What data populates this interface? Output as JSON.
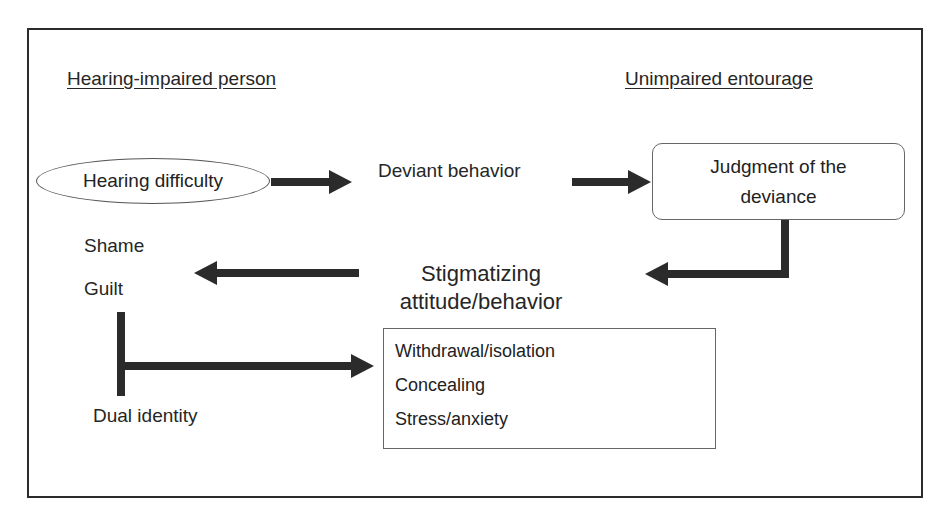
{
  "headers": {
    "left": "Hearing-impaired person",
    "right": "Unimpaired entourage"
  },
  "nodes": {
    "hearing_difficulty": "Hearing difficulty",
    "deviant_behavior": "Deviant behavior",
    "judgment_line1": "Judgment of the",
    "judgment_line2": "deviance",
    "stigmatizing_line1": "Stigmatizing",
    "stigmatizing_line2": "attitude/behavior",
    "shame": "Shame",
    "guilt": "Guilt",
    "dual_identity": "Dual identity"
  },
  "consequences": {
    "items": [
      "Withdrawal/isolation",
      "Concealing",
      "Stress/anxiety"
    ]
  },
  "edges": [
    {
      "from": "Hearing difficulty",
      "to": "Deviant behavior"
    },
    {
      "from": "Deviant behavior",
      "to": "Judgment of the deviance"
    },
    {
      "from": "Judgment of the deviance",
      "to": "Stigmatizing attitude/behavior"
    },
    {
      "from": "Stigmatizing attitude/behavior",
      "to": "Shame / Guilt"
    },
    {
      "from": "Shame / Guilt / Dual identity",
      "to": "Withdrawal/isolation, Concealing, Stress/anxiety"
    }
  ],
  "colors": {
    "stroke": "#2b2b2b",
    "text": "#262626",
    "box_border": "#666666"
  }
}
